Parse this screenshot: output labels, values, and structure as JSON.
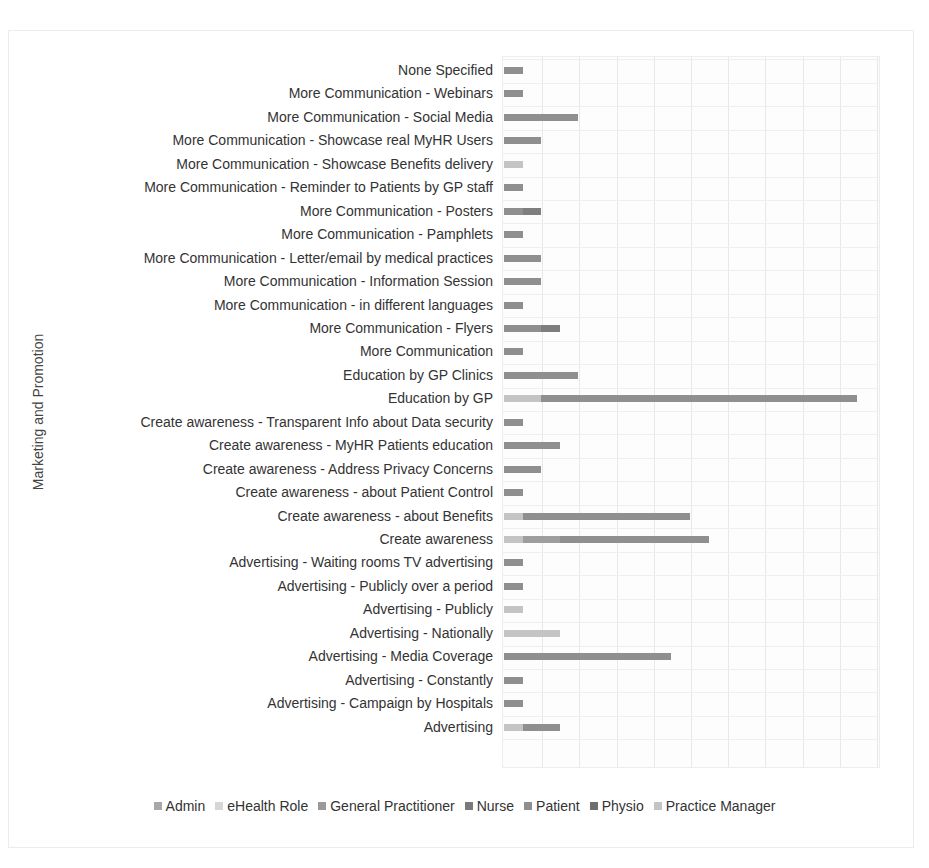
{
  "chart_data": {
    "type": "bar",
    "orientation": "horizontal",
    "stacked": true,
    "title": "",
    "xlabel": "",
    "ylabel": "Marketing and Promotion",
    "xlim": [
      0,
      20
    ],
    "grid": true,
    "legend_position": "bottom",
    "categories": [
      "None Specified",
      "More Communication - Webinars",
      "More Communication - Social Media",
      "More Communication - Showcase real MyHR Users",
      "More Communication - Showcase Benefits delivery",
      "More Communication - Reminder to Patients by GP staff",
      "More Communication - Posters",
      "More Communication - Pamphlets",
      "More Communication - Letter/email by medical practices",
      "More Communication - Information Session",
      "More Communication - in different languages",
      "More Communication - Flyers",
      "More Communication",
      "Education by GP Clinics",
      "Education by GP",
      "Create awareness - Transparent Info about Data security",
      "Create awareness - MyHR Patients education",
      "Create awareness - Address Privacy Concerns",
      "Create awareness - about Patient Control",
      "Create awareness - about Benefits",
      "Create awareness",
      "Advertising - Waiting rooms TV advertising",
      "Advertising - Publicly over a period",
      "Advertising - Publicly",
      "Advertising - Nationally",
      "Advertising - Media Coverage",
      "Advertising - Constantly",
      "Advertising - Campaign by Hospitals",
      "Advertising"
    ],
    "series": [
      {
        "name": "Admin",
        "color": "#a8a8a8",
        "values": [
          0,
          0,
          0,
          0,
          0,
          0,
          0,
          0,
          0,
          0,
          0,
          0,
          0,
          0,
          0,
          0,
          0,
          0,
          0,
          0,
          0,
          0,
          0,
          0,
          0,
          0,
          0,
          0,
          0
        ]
      },
      {
        "name": "eHealth Role",
        "color": "#cfcfcf",
        "values": [
          0,
          0,
          0,
          0,
          0,
          0,
          0,
          0,
          0,
          0,
          0,
          0,
          0,
          0,
          0,
          0,
          0,
          0,
          0,
          0,
          0,
          0,
          0,
          0,
          0,
          0,
          0,
          0,
          0
        ]
      },
      {
        "name": "General Practitioner",
        "color": "#9a9a9a",
        "values": [
          0,
          0,
          0,
          0,
          0,
          0,
          0,
          0,
          0,
          0,
          0,
          0,
          0,
          0,
          0,
          0,
          0,
          0,
          0,
          0,
          0,
          0,
          0,
          0,
          0,
          0,
          0,
          0,
          0
        ]
      },
      {
        "name": "Nurse",
        "color": "#7e7e7e",
        "values": [
          0,
          0,
          0,
          0,
          0,
          0,
          1,
          0,
          0,
          0,
          0,
          1,
          0,
          0,
          0,
          0,
          0,
          0,
          0,
          0,
          0,
          0,
          0,
          0,
          0,
          0,
          0,
          0,
          0
        ]
      },
      {
        "name": "Patient",
        "color": "#8f8f8f",
        "values": [
          1,
          1,
          4,
          2,
          0,
          1,
          1,
          1,
          2,
          2,
          1,
          2,
          1,
          4,
          17,
          1,
          3,
          2,
          1,
          9,
          8,
          1,
          1,
          0,
          0,
          9,
          1,
          1,
          2
        ]
      },
      {
        "name": "Physio",
        "color": "#9e9e9e",
        "values": [
          0,
          0,
          0,
          0,
          0,
          0,
          0,
          0,
          0,
          0,
          0,
          0,
          0,
          0,
          0,
          0,
          0,
          0,
          0,
          0,
          2,
          0,
          0,
          0,
          0,
          0,
          0,
          0,
          0
        ]
      },
      {
        "name": "Practice Manager",
        "color": "#c4c4c4",
        "values": [
          0,
          0,
          0,
          0,
          1,
          0,
          0,
          0,
          0,
          0,
          0,
          0,
          0,
          0,
          2,
          0,
          0,
          0,
          0,
          1,
          1,
          0,
          0,
          1,
          3,
          0,
          0,
          0,
          1
        ]
      }
    ]
  },
  "legend": {
    "items": [
      {
        "label": "Admin",
        "color": "#a8a8a8"
      },
      {
        "label": "eHealth Role",
        "color": "#d6d6d6"
      },
      {
        "label": "General Practitioner",
        "color": "#9a9a9a"
      },
      {
        "label": "Nurse",
        "color": "#7a7a7a"
      },
      {
        "label": "Patient",
        "color": "#8f8f8f"
      },
      {
        "label": "Physio",
        "color": "#6e6e6e"
      },
      {
        "label": "Practice Manager",
        "color": "#c4c4c4"
      }
    ]
  }
}
